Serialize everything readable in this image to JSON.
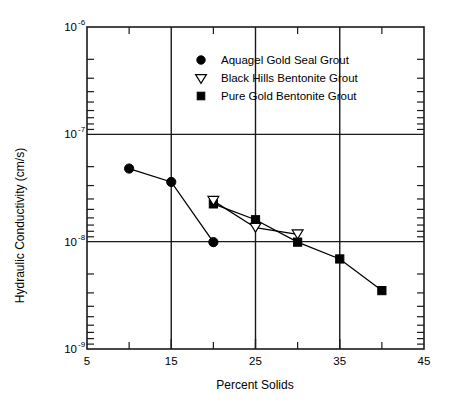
{
  "chart_data": {
    "type": "line",
    "title": "",
    "xlabel": "Percent Solids",
    "ylabel": "Hydraulic Conductivity (cm/s)",
    "xlim": [
      5,
      45
    ],
    "ylim": [
      1e-09,
      1e-06
    ],
    "yscale": "log",
    "xscale": "linear",
    "grid": true,
    "grid_note": "major gridlines at x = 15, 25, 35 and y = 1e-7, 1e-8",
    "legend_position": "upper-center",
    "x_ticks_major": [
      5,
      15,
      25,
      35,
      45
    ],
    "x_tick_labels": [
      "5",
      "15",
      "25",
      "35",
      "45"
    ],
    "x_ticks_minor": [
      10,
      20,
      30,
      40
    ],
    "y_ticks_major": [
      1e-06,
      1e-07,
      1e-08,
      1e-09
    ],
    "y_tick_labels": [
      "10-6",
      "10-7",
      "10-8",
      "10-9"
    ],
    "y_tick_mantissa": "10",
    "y_tick_exponents": [
      "-6",
      "-7",
      "-8",
      "-9"
    ],
    "series": [
      {
        "name": "Aquagel Gold Seal Grout",
        "marker": "circle-filled",
        "x": [
          10,
          15,
          20
        ],
        "values": [
          4.8e-08,
          3.6e-08,
          9.9e-09
        ]
      },
      {
        "name": "Black Hills Bentonite Grout",
        "marker": "triangle-down-open",
        "x": [
          20,
          25,
          30
        ],
        "values": [
          2.4e-08,
          1.35e-08,
          1.17e-08
        ]
      },
      {
        "name": "Pure Gold Bentonite Grout",
        "marker": "square-filled",
        "x": [
          20,
          25,
          30,
          35,
          40
        ],
        "values": [
          2.25e-08,
          1.6e-08,
          9.9e-09,
          6.9e-09,
          3.5e-09
        ]
      }
    ]
  },
  "legend": {
    "entries": [
      {
        "label": "Aquagel Gold Seal Grout",
        "marker": "circle-filled"
      },
      {
        "label": "Black Hills Bentonite Grout",
        "marker": "triangle-down-open"
      },
      {
        "label": "Pure Gold Bentonite Grout",
        "marker": "square-filled"
      }
    ]
  },
  "axes": {
    "x_title": "Percent Solids",
    "y_title": "Hydraulic Conductivity (cm/s)",
    "x_tick_labels": [
      "5",
      "15",
      "25",
      "35",
      "45"
    ],
    "y_tick_base": [
      "10",
      "10",
      "10",
      "10"
    ],
    "y_tick_exponents": [
      "-6",
      "-7",
      "-8",
      "-9"
    ]
  },
  "colors": {
    "foreground": "#000000",
    "axis": "#1a1a1a",
    "background": "#ffffff",
    "marker_fill_open": "#ffffff"
  }
}
